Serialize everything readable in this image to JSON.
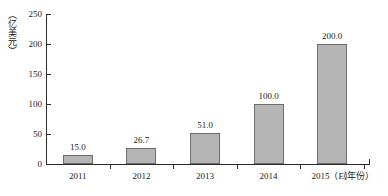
{
  "chart_data": {
    "type": "bar",
    "title": "",
    "subtitle": "",
    "xlabel": "（年份）",
    "ylabel": "（亿美元）",
    "categories": [
      "2011",
      "2012",
      "2013",
      "2014",
      "2015（E）"
    ],
    "values": [
      15.0,
      26.7,
      51.0,
      100.0,
      200.0
    ],
    "data_labels": [
      "15.0",
      "26.7",
      "51.0",
      "100.0",
      "200.0"
    ],
    "ylim": [
      0,
      250
    ],
    "yticks": [
      0,
      50,
      100,
      150,
      200,
      250
    ],
    "ytick_labels": [
      "0",
      "50",
      "100",
      "150",
      "200",
      "250"
    ],
    "grid": false,
    "legend": null,
    "series": [
      {
        "name": "",
        "values": [
          15.0,
          26.7,
          51.0,
          100.0,
          200.0
        ]
      }
    ],
    "colors": {
      "bar_fill": "#b5b5b5",
      "bar_stroke": "#6d6d6d",
      "axis": "#2b2b2b",
      "text": "#1a1a1a",
      "background": "#ffffff"
    }
  }
}
